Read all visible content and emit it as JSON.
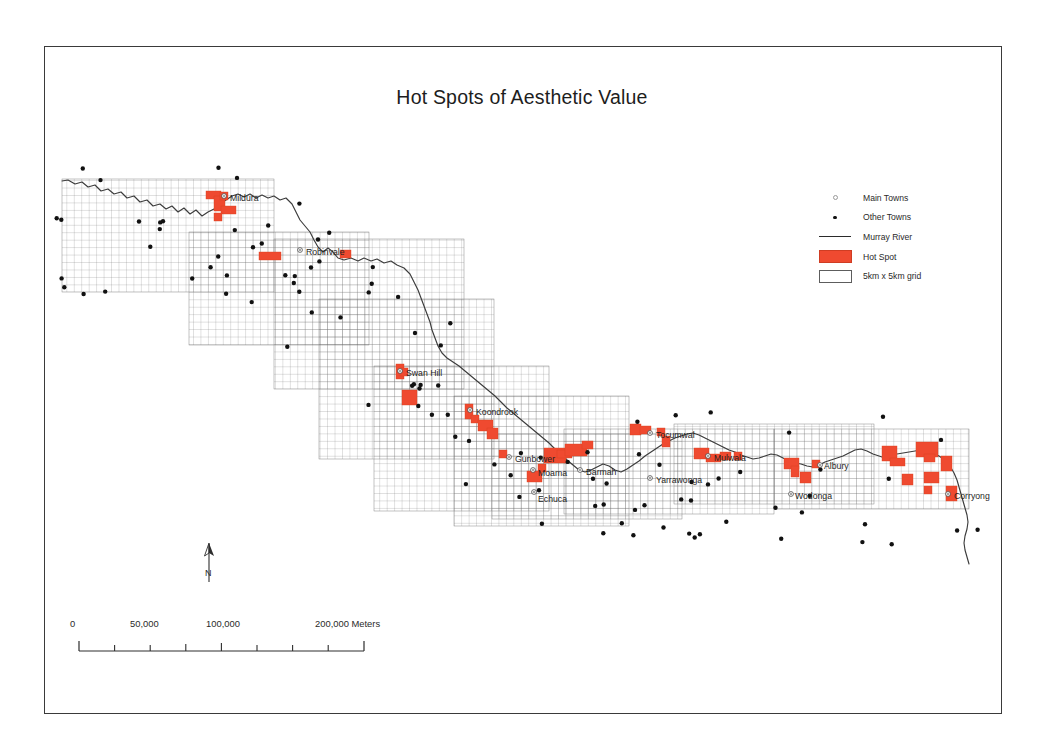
{
  "figure": {
    "title": "Hot Spots of Aesthetic Value",
    "frame_color": "#3a3a3a",
    "background": "#ffffff"
  },
  "legend": {
    "items": [
      {
        "symbol": "main-town-circle",
        "label": "Main Towns"
      },
      {
        "symbol": "other-town-dot",
        "label": "Other Towns"
      },
      {
        "symbol": "river-line",
        "label": "Murray River"
      },
      {
        "symbol": "hotspot-swatch",
        "label": "Hot Spot"
      },
      {
        "symbol": "grid-swatch",
        "label": "5km x 5km grid"
      }
    ],
    "colors": {
      "hotspot": "#ef4a30",
      "river": "#2b2b2b",
      "grid_line": "#6e6e6e",
      "town_dot": "#111111"
    }
  },
  "north_arrow": {
    "label": "N"
  },
  "scalebar": {
    "units": "Meters",
    "tick_labels": [
      "0",
      "50,000",
      "100,000",
      "200,000 Meters"
    ],
    "tick_values": [
      0,
      50000,
      100000,
      200000
    ],
    "minor_tick_interval": 25000,
    "max_value": 200000
  },
  "chart_data": {
    "type": "map",
    "title": "Hot Spots of Aesthetic Value",
    "grid_cell_km": 5,
    "main_towns": [
      {
        "name": "Mildura",
        "x": 224,
        "y": 196,
        "label_dx": 6,
        "label_dy": 3
      },
      {
        "name": "Robinvale",
        "x": 300,
        "y": 250,
        "label_dx": 6,
        "label_dy": 3
      },
      {
        "name": "Swan Hill",
        "x": 400,
        "y": 371,
        "label_dx": 6,
        "label_dy": 3
      },
      {
        "name": "Koondrook",
        "x": 470,
        "y": 410,
        "label_dx": 6,
        "label_dy": 3
      },
      {
        "name": "Gunbower",
        "x": 509,
        "y": 457,
        "label_dx": 6,
        "label_dy": 3
      },
      {
        "name": "Moama",
        "x": 533,
        "y": 470,
        "label_dx": 5,
        "label_dy": 4
      },
      {
        "name": "Echuca",
        "x": 534,
        "y": 492,
        "label_dx": 4,
        "label_dy": 8
      },
      {
        "name": "Barmah",
        "x": 580,
        "y": 470,
        "label_dx": 6,
        "label_dy": 3
      },
      {
        "name": "Tocumwal",
        "x": 650,
        "y": 433,
        "label_dx": 6,
        "label_dy": 3
      },
      {
        "name": "Yarrawonga",
        "x": 650,
        "y": 478,
        "label_dx": 6,
        "label_dy": 3
      },
      {
        "name": "Mulwala",
        "x": 708,
        "y": 456,
        "label_dx": 6,
        "label_dy": 3
      },
      {
        "name": "Albury",
        "x": 820,
        "y": 465,
        "label_dx": 4,
        "label_dy": 2
      },
      {
        "name": "Wodonga",
        "x": 791,
        "y": 494,
        "label_dx": 4,
        "label_dy": 3
      },
      {
        "name": "Corryong",
        "x": 948,
        "y": 494,
        "label_dx": 6,
        "label_dy": 3
      }
    ],
    "other_town_count": 118,
    "hotspot_count": 48
  }
}
